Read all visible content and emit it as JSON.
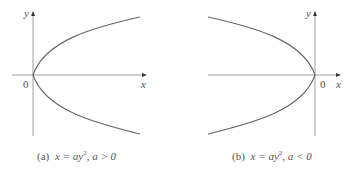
{
  "figure": {
    "panels": [
      {
        "id": "a",
        "caption_prefix": "(a)",
        "caption_eq": "x = ay",
        "caption_exp": "2",
        "caption_cond": ",  a > 0",
        "axis_x_label": "x",
        "axis_y_label": "y",
        "origin_label": "0",
        "opens": "right"
      },
      {
        "id": "b",
        "caption_prefix": "(b)",
        "caption_eq": "x = ay",
        "caption_exp": "2",
        "caption_cond": ",  a < 0",
        "axis_x_label": "x",
        "axis_y_label": "y",
        "origin_label": "0",
        "opens": "left"
      }
    ],
    "colors": {
      "axis": "#777777",
      "curve": "#666666",
      "text": "#555555"
    }
  }
}
